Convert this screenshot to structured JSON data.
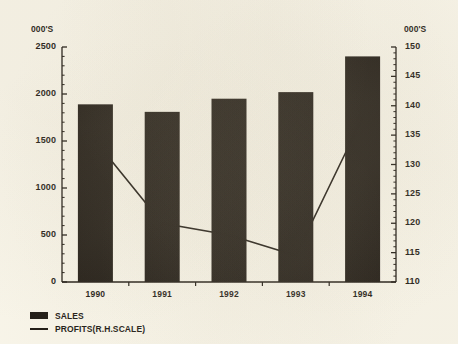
{
  "chart_data": {
    "type": "bar",
    "title": "",
    "subtitle": "",
    "xlabel": "",
    "ylabel": "000'S",
    "y2label": "000'S",
    "grid": false,
    "legend_position": "bottom-left",
    "categories": [
      "1990",
      "1991",
      "1992",
      "1993",
      "1994"
    ],
    "left_axis": {
      "label": "000'S",
      "min": 0,
      "max": 2500,
      "step": 500,
      "ticks": [
        "0",
        "500",
        "1000",
        "1500",
        "2000",
        "2500"
      ],
      "minor_ticks_per_interval": 5
    },
    "right_axis": {
      "label": "000'S",
      "min": 110,
      "max": 150,
      "step": 5,
      "ticks": [
        "110",
        "115",
        "120",
        "125",
        "130",
        "135",
        "140",
        "145",
        "150"
      ],
      "minor_ticks_per_interval": 5
    },
    "series": [
      {
        "name": "SALES",
        "type": "bar",
        "axis": "left",
        "color": "#17120d",
        "values": [
          1890,
          1810,
          1950,
          2020,
          2400
        ]
      },
      {
        "name": "PROFITS(R.H.SCALE)",
        "type": "line",
        "axis": "right",
        "color": "#17120d",
        "values": [
          134,
          120,
          118,
          114.5,
          138
        ]
      }
    ],
    "legend": [
      {
        "label": "SALES",
        "marker": "filled-square"
      },
      {
        "label": "PROFITS(R.H.SCALE)",
        "marker": "line"
      }
    ],
    "colors": {
      "ink": "#17120d",
      "paper": "#faf7ec",
      "bar_fill": "#17120d",
      "line_stroke": "#17120d"
    }
  }
}
